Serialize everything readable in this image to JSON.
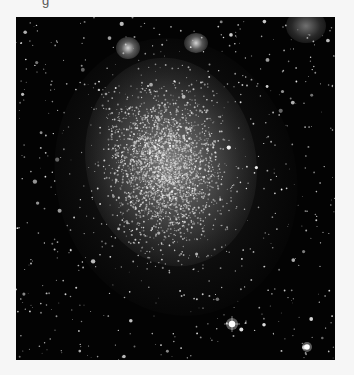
{
  "page": {
    "background_color": "#f6f6f6",
    "caption_fragment": "g"
  },
  "photo": {
    "subject": "irregular dwarf galaxy starfield",
    "alt": "Black-and-white astronomical photograph of a dense irregular dwarf galaxy star cloud on a black sky with scattered foreground stars",
    "background_color": "#030303",
    "bright_features": [
      {
        "name": "galaxy-core-glow",
        "x": 155,
        "y": 145
      },
      {
        "name": "nebula-top-right",
        "x": 290,
        "y": 5
      },
      {
        "name": "bright-knot-top-left",
        "x": 112,
        "y": 31
      },
      {
        "name": "bright-knot-top-center",
        "x": 180,
        "y": 27
      },
      {
        "name": "bright-star-bottom",
        "x": 216,
        "y": 307
      },
      {
        "name": "bright-star-bottom-right",
        "x": 291,
        "y": 330
      }
    ]
  }
}
